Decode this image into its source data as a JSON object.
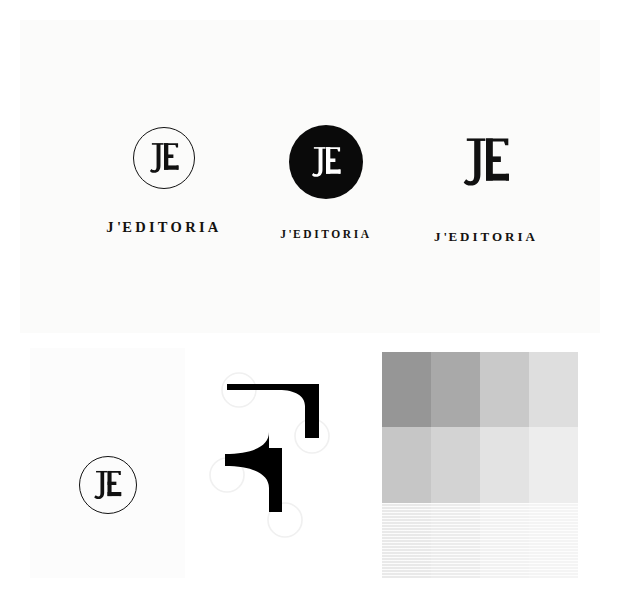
{
  "board": {
    "title": "J'EDITORIA Brand Identity Board",
    "background": "#ffffff"
  },
  "panels": {
    "logo_variants": {
      "name": "Logo Variants Panel",
      "background": "#fbfbfa"
    },
    "mark_card": {
      "name": "Monogram Card",
      "background": "#fcfcfc"
    },
    "letter_anatomy": {
      "name": "Serif Anatomy Detail",
      "background": "#ffffff"
    },
    "color_palette": {
      "name": "Grayscale Palette Grid"
    }
  },
  "brand": {
    "wordmark": "J'EDITORIA",
    "wordmark_parts": {
      "j": "J",
      "apostrophe": "'",
      "rest": "EDITORIA"
    },
    "monogram": "JE",
    "ink": "#111111",
    "paper": "#ffffff"
  },
  "lockups": [
    {
      "id": "outline-circle",
      "mark_name": "je-monogram-outline-circle-icon",
      "mark_style": "circle-outline",
      "wordmark": "J'EDITORIA"
    },
    {
      "id": "solid-circle",
      "mark_name": "je-monogram-solid-circle-icon",
      "mark_style": "circle-solid",
      "wordmark": "J'EDITORIA"
    },
    {
      "id": "plain",
      "mark_name": "je-monogram-plain-icon",
      "mark_style": "plain",
      "wordmark": "J'EDITORIA"
    }
  ],
  "mark_card": {
    "mark_name": "je-monogram-outline-circle-icon",
    "monogram": "JE"
  },
  "letter_anatomy": {
    "detail_name": "serif-bracket-detail",
    "ink": "#000000"
  },
  "color_palette": {
    "rows": 3,
    "columns": 4,
    "swatches": [
      {
        "name": "gray-1",
        "hex": "#969696",
        "striped": false
      },
      {
        "name": "gray-2",
        "hex": "#a9a9a9",
        "striped": false
      },
      {
        "name": "gray-3",
        "hex": "#c9c9c9",
        "striped": false
      },
      {
        "name": "gray-4",
        "hex": "#dedede",
        "striped": false
      },
      {
        "name": "gray-5",
        "hex": "#c6c6c6",
        "striped": false
      },
      {
        "name": "gray-6",
        "hex": "#d3d3d3",
        "striped": false
      },
      {
        "name": "gray-7",
        "hex": "#e3e3e3",
        "striped": false
      },
      {
        "name": "gray-8",
        "hex": "#ededed",
        "striped": false
      },
      {
        "name": "gray-9",
        "hex": "#e9e9e9",
        "striped": true
      },
      {
        "name": "gray-10",
        "hex": "#ececec",
        "striped": true
      },
      {
        "name": "gray-11",
        "hex": "#f2f2f2",
        "striped": true
      },
      {
        "name": "gray-12",
        "hex": "#f4f4f4",
        "striped": true
      }
    ]
  }
}
